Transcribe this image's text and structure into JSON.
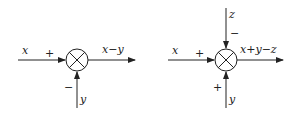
{
  "diagrams": [
    {
      "name": "subtractor",
      "inputs": {
        "left": {
          "label": "x",
          "sign": "+"
        },
        "bottom": {
          "label": "y",
          "sign": "−"
        }
      },
      "output": {
        "label": "x−y"
      }
    },
    {
      "name": "adder-subtractor",
      "inputs": {
        "left": {
          "label": "x",
          "sign": "+"
        },
        "top": {
          "label": "z",
          "sign": "−"
        },
        "bottom": {
          "label": "y",
          "sign": "+"
        }
      },
      "output": {
        "label": "x+y−z"
      }
    }
  ],
  "colors": {
    "stroke": "#222222",
    "background": "#ffffff"
  }
}
